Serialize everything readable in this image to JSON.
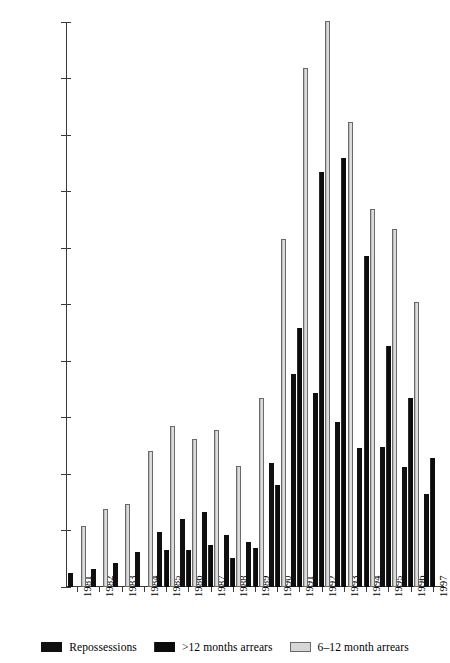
{
  "chart_data": {
    "type": "bar",
    "title": "",
    "subtitle": "",
    "xlabel": "",
    "ylabel": "",
    "ylim": [
      0,
      200000
    ],
    "ytick_step": 20000,
    "yticks": [
      0,
      20000,
      40000,
      60000,
      80000,
      100000,
      120000,
      140000,
      160000,
      180000,
      200000
    ],
    "ytick_labels": [
      "0",
      "20000",
      "40000",
      "60000",
      "80000",
      "100000",
      "120000",
      "140000",
      "160000",
      "180000",
      "200000"
    ],
    "grid": false,
    "legend_position": "bottom",
    "categories": [
      "1981",
      "1982",
      "1983",
      "1984",
      "1985",
      "1986",
      "1987",
      "1988",
      "1989",
      "1990",
      "1991",
      "1992",
      "1993",
      "1994",
      "1995",
      "1996",
      "1997"
    ],
    "series": [
      {
        "name": "Repossessions",
        "color": "#101010",
        "values": [
          4900,
          6400,
          8400,
          12400,
          19300,
          24100,
          26400,
          18500,
          15800,
          44000,
          75500,
          68600,
          58500,
          49200,
          49400,
          42600,
          32800
        ]
      },
      {
        "name": ">12 months arrears",
        "color": "#141414",
        "values": [
          null,
          null,
          null,
          null,
          13000,
          13000,
          15000,
          10400,
          13800,
          36100,
          91700,
          147000,
          151800,
          117100,
          85200,
          67000,
          45600
        ]
      },
      {
        "name": "6–12 month arrears",
        "color": "#d2d2d2",
        "values": [
          21500,
          27500,
          29400,
          48300,
          57100,
          52400,
          55500,
          42800,
          66800,
          123100,
          183600,
          200500,
          164600,
          133700,
          126700,
          100900,
          null
        ]
      }
    ]
  },
  "legend": {
    "items": [
      {
        "label": "Repossessions",
        "swatch": "legend-swatch-repossessions"
      },
      {
        "label": ">12 months arrears",
        "swatch": "legend-swatch-over12"
      },
      {
        "label": "6–12 month arrears",
        "swatch": "legend-swatch-6to12"
      }
    ]
  }
}
